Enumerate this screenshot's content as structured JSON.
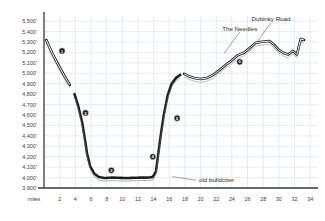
{
  "chart_data": {
    "type": "line",
    "title": "",
    "xlabel": "miles",
    "ylabel": "",
    "xlim": [
      0,
      35
    ],
    "ylim": [
      3900,
      5550
    ],
    "grid": true,
    "legend_position": "none",
    "x_unit_label": "miles",
    "x_ticks": [
      2,
      4,
      6,
      8,
      10,
      12,
      14,
      16,
      18,
      20,
      22,
      24,
      26,
      28,
      30,
      32,
      34
    ],
    "y_ticks": [
      "3,900'",
      "4,000'",
      "4,100'",
      "4,200'",
      "4,300'",
      "4,400'",
      "4,500'",
      "4,600'",
      "4,700'",
      "4,800'",
      "4,900'",
      "5,000'",
      "5,100'",
      "5,200'",
      "5,300'",
      "5,400'",
      "5,500'"
    ],
    "series": [
      {
        "name": "elevation-profile",
        "x": [
          0.3,
          1.0,
          1.8,
          2.6,
          3.3,
          3.9,
          4.4,
          4.9,
          5.2,
          5.5,
          5.9,
          6.4,
          7.0,
          7.8,
          8.6,
          9.5,
          10.5,
          11.5,
          12.5,
          13.3,
          13.9,
          14.3,
          14.6,
          14.9,
          15.3,
          15.8,
          16.3,
          16.9,
          17.4,
          17.9,
          18.4,
          19.2,
          20.0,
          20.8,
          21.6,
          22.4,
          23.2,
          24.0,
          24.8,
          25.6,
          26.4,
          27.0,
          27.6,
          28.2,
          28.8,
          29.4,
          30.0,
          30.6,
          31.2,
          31.8,
          32.3,
          32.8,
          33.2
        ],
        "y": [
          5320,
          5200,
          5085,
          4975,
          4890,
          4800,
          4680,
          4520,
          4380,
          4230,
          4110,
          4040,
          4005,
          3995,
          4000,
          3998,
          3995,
          3998,
          4000,
          4000,
          4005,
          4060,
          4230,
          4400,
          4600,
          4790,
          4900,
          4960,
          4985,
          4995,
          4975,
          4955,
          4945,
          4955,
          4985,
          5030,
          5080,
          5125,
          5175,
          5200,
          5250,
          5290,
          5300,
          5305,
          5310,
          5275,
          5225,
          5195,
          5180,
          5215,
          5180,
          5330,
          5320
        ]
      }
    ],
    "segments": [
      {
        "style": "solid-band",
        "from_x": 0.3,
        "to_x": 3.7,
        "note": "paved"
      },
      {
        "style": "dotted-band",
        "from_x": 3.7,
        "to_x": 17.6,
        "note": "unpaved"
      },
      {
        "style": "solid-band",
        "from_x": 17.6,
        "to_x": 33.2,
        "note": "paved"
      }
    ],
    "annotations": [
      {
        "label": "The Needles",
        "x": 25.0,
        "y": 5410,
        "target_x": 23.0,
        "target_y": 5190
      },
      {
        "label": "Dubinky Road",
        "x": 29.0,
        "y": 5500,
        "target_x": 27.2,
        "target_y": 5300
      },
      {
        "label": "old bulldozer",
        "x": 19.8,
        "y": 3960,
        "target_x": 16.4,
        "target_y": 4010
      }
    ],
    "markers": [
      {
        "number": "1",
        "x": 2.3,
        "y": 5215
      },
      {
        "number": "2",
        "x": 5.3,
        "y": 4620
      },
      {
        "number": "3",
        "x": 8.6,
        "y": 4070
      },
      {
        "number": "4",
        "x": 13.9,
        "y": 4200
      },
      {
        "number": "5",
        "x": 17.0,
        "y": 4570
      },
      {
        "number": "6",
        "x": 25.0,
        "y": 5110
      }
    ]
  },
  "colors": {
    "grid": "#d5dfe8",
    "axis": "#3a3a3a",
    "line": "#1c1c1c",
    "band_fill": "#ffffff",
    "text": "#3b3b3b",
    "marker_fill": "#1c1c1c",
    "background": "#ffffff"
  }
}
